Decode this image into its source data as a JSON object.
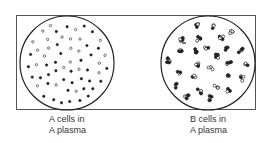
{
  "panels": [
    {
      "id": "left",
      "label_line1": "A cells in",
      "label_line2": "A plasma",
      "state": "unagglutinated",
      "circle": {
        "cx": 67,
        "cy": 63,
        "r": 47
      }
    },
    {
      "id": "right",
      "label_line1": "B cells in",
      "label_line2": "A plasma",
      "state": "agglutinated",
      "circle": {
        "cx": 208,
        "cy": 63,
        "r": 47
      }
    }
  ],
  "colors": {
    "ink": "#222222",
    "frame": "#555555",
    "background": "#ffffff"
  }
}
